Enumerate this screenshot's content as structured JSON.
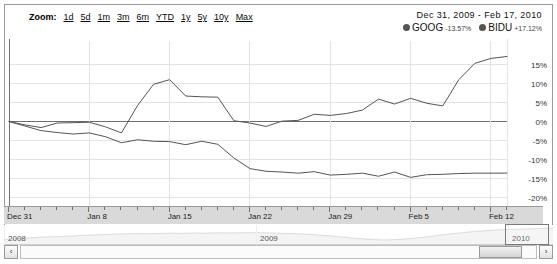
{
  "toolbar": {
    "zoom_label": "Zoom:",
    "zoom_links": [
      {
        "label": "1d"
      },
      {
        "label": "5d"
      },
      {
        "label": "1m"
      },
      {
        "label": "3m"
      },
      {
        "label": "6m"
      },
      {
        "label": "YTD"
      },
      {
        "label": "1y"
      },
      {
        "label": "5y"
      },
      {
        "label": "10y"
      },
      {
        "label": "Max"
      }
    ]
  },
  "range": {
    "start_date": "Dec 31, 2009",
    "separator": "-",
    "end_date": "Feb 17, 2010",
    "full": "Dec 31, 2009  -  Feb 17, 2010"
  },
  "legend": [
    {
      "name": "GOOG",
      "change": "-13.57%",
      "color": "#555555"
    },
    {
      "name": "BIDU",
      "change": "+17.12%",
      "color": "#555555"
    }
  ],
  "navigator": {
    "years": [
      {
        "label": "2008",
        "x": 4
      },
      {
        "label": "2009",
        "x": 256
      },
      {
        "label": "2010",
        "x": 508
      }
    ],
    "selection": {
      "x": 501,
      "width": 44
    },
    "left_arrow": "‹",
    "right_arrow": "›"
  },
  "scrollbar": {
    "left_arrow": "‹",
    "right_arrow": "›",
    "thumb": {
      "x": 474,
      "width": 43
    }
  },
  "chart_data": {
    "type": "line",
    "title": "",
    "xlabel": "",
    "ylabel": "",
    "ylim": [
      -22.5,
      17.5
    ],
    "ytick_values": [
      15,
      10,
      5,
      0,
      -5,
      -10,
      -15,
      -20
    ],
    "ytick_labels": [
      "15%",
      "10%",
      "5%",
      "0%",
      "-5%",
      "-10%",
      "-15%",
      "-20%"
    ],
    "grid": true,
    "legend_position": "top-right",
    "xtick_labels": [
      "Dec 31",
      "Jan 8",
      "Jan 15",
      "Jan 22",
      "Jan 29",
      "Feb 5",
      "Feb 12"
    ],
    "xtick_index": [
      0,
      5,
      10,
      15,
      20,
      25,
      30
    ],
    "x": [
      "Dec 31",
      "Jan 4",
      "Jan 5",
      "Jan 6",
      "Jan 7",
      "Jan 8",
      "Jan 11",
      "Jan 12",
      "Jan 13",
      "Jan 14",
      "Jan 15",
      "Jan 19",
      "Jan 20",
      "Jan 21",
      "Jan 22",
      "Jan 25",
      "Jan 26",
      "Jan 27",
      "Jan 28",
      "Jan 29",
      "Feb 1",
      "Feb 2",
      "Feb 3",
      "Feb 4",
      "Feb 5",
      "Feb 8",
      "Feb 9",
      "Feb 10",
      "Feb 11",
      "Feb 12",
      "Feb 16",
      "Feb 17"
    ],
    "series": [
      {
        "name": "BIDU",
        "color": "#555555",
        "end_value": 17.12,
        "values": [
          0.0,
          -0.9,
          -1.6,
          -0.4,
          -0.3,
          -0.2,
          -1.4,
          -3.0,
          4.2,
          9.8,
          11.0,
          6.7,
          6.5,
          6.4,
          0.2,
          -0.4,
          -1.3,
          0.1,
          0.3,
          1.9,
          1.6,
          2.1,
          3.0,
          5.9,
          4.6,
          6.1,
          4.8,
          4.1,
          11.0,
          15.3,
          16.6,
          17.12
        ]
      },
      {
        "name": "GOOG",
        "color": "#555555",
        "end_value": -13.57,
        "values": [
          0.0,
          -1.2,
          -2.4,
          -2.9,
          -3.3,
          -3.0,
          -4.0,
          -5.6,
          -4.8,
          -5.2,
          -5.3,
          -6.1,
          -5.2,
          -6.0,
          -9.6,
          -12.4,
          -13.1,
          -13.3,
          -13.6,
          -13.2,
          -14.1,
          -13.9,
          -13.6,
          -14.4,
          -13.3,
          -14.7,
          -14.0,
          -13.9,
          -13.7,
          -13.6,
          -13.6,
          -13.57
        ]
      }
    ],
    "navigator_series": {
      "name": "overview",
      "color": "#e2e2e2",
      "values": [
        -2,
        -1.5,
        -1.2,
        -0.8,
        -0.6,
        -0.4,
        -0.2,
        0.2,
        0.4,
        0.6,
        0.9,
        1.0,
        1.1,
        1.0,
        1.2,
        1.3,
        1.2,
        1.4,
        1.3,
        1.5,
        1.4,
        1.5,
        1.6,
        1.5,
        1.4,
        1.2,
        1.1,
        0.8,
        0.4,
        0.0,
        -0.6,
        -1.2,
        -1.6,
        -2.0,
        -2.2,
        -2.0,
        -1.6,
        -1.0,
        -0.4,
        0.4,
        1.0,
        1.6,
        2.2,
        2.6,
        3.0,
        3.2,
        3.4,
        3.6,
        3.8,
        4.0
      ]
    }
  }
}
